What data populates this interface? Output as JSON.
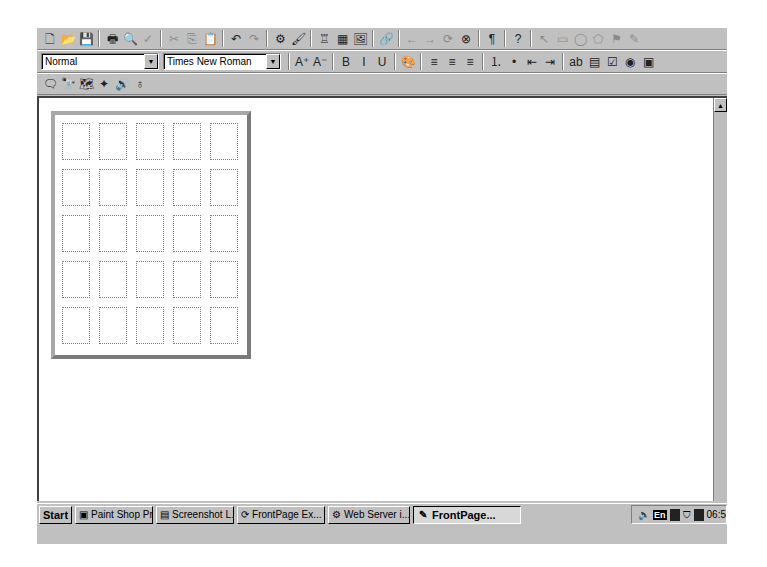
{
  "toolbar_standard": {
    "buttons": [
      {
        "name": "new-page",
        "glyph": "🗋"
      },
      {
        "name": "open",
        "glyph": "📂"
      },
      {
        "name": "save",
        "glyph": "💾"
      },
      {
        "name": "print",
        "glyph": "🖶"
      },
      {
        "name": "print-preview",
        "glyph": "🔍"
      },
      {
        "name": "spelling",
        "glyph": "✓"
      },
      {
        "name": "cut",
        "glyph": "✂"
      },
      {
        "name": "copy",
        "glyph": "⎘"
      },
      {
        "name": "paste",
        "glyph": "📋"
      },
      {
        "name": "undo",
        "glyph": "↶"
      },
      {
        "name": "redo",
        "glyph": "↷"
      },
      {
        "name": "insert-component",
        "glyph": "⚙"
      },
      {
        "name": "format-painter",
        "glyph": "🖌"
      },
      {
        "name": "insert-form-field",
        "glyph": "♖"
      },
      {
        "name": "insert-table",
        "glyph": "▦"
      },
      {
        "name": "insert-image",
        "glyph": "🖼"
      },
      {
        "name": "hyperlink",
        "glyph": "🔗"
      },
      {
        "name": "back",
        "glyph": "←"
      },
      {
        "name": "forward",
        "glyph": "→"
      },
      {
        "name": "refresh",
        "glyph": "⟳"
      },
      {
        "name": "stop",
        "glyph": "⊗"
      },
      {
        "name": "show-all",
        "glyph": "¶"
      },
      {
        "name": "help",
        "glyph": "?"
      },
      {
        "name": "select-pointer",
        "glyph": "↖"
      },
      {
        "name": "rectangle",
        "glyph": "▭"
      },
      {
        "name": "circle",
        "glyph": "◯"
      },
      {
        "name": "polygon",
        "glyph": "⬠"
      },
      {
        "name": "highlight-hotspots",
        "glyph": "⚑"
      },
      {
        "name": "pencil",
        "glyph": "✎"
      }
    ]
  },
  "toolbar_format": {
    "style_value": "Normal",
    "font_value": "Times New Roman",
    "buttons": [
      {
        "name": "increase-font-size",
        "glyph": "A⁺"
      },
      {
        "name": "decrease-font-size",
        "glyph": "A⁻"
      },
      {
        "name": "bold",
        "glyph": "B"
      },
      {
        "name": "italic",
        "glyph": "I"
      },
      {
        "name": "underline",
        "glyph": "U"
      },
      {
        "name": "text-color",
        "glyph": "🎨"
      },
      {
        "name": "align-left",
        "glyph": "≡"
      },
      {
        "name": "align-center",
        "glyph": "≡"
      },
      {
        "name": "align-right",
        "glyph": "≡"
      },
      {
        "name": "numbered-list",
        "glyph": "⒈"
      },
      {
        "name": "bulleted-list",
        "glyph": "•"
      },
      {
        "name": "decrease-indent",
        "glyph": "⇤"
      },
      {
        "name": "increase-indent",
        "glyph": "⇥"
      },
      {
        "name": "one-line-text-box",
        "glyph": "ab"
      },
      {
        "name": "scrolling-text-box",
        "glyph": "▤"
      },
      {
        "name": "check-box",
        "glyph": "☑"
      },
      {
        "name": "radio-button",
        "glyph": "◉"
      },
      {
        "name": "drop-down-menu",
        "glyph": "▣"
      }
    ]
  },
  "toolbar_extra": {
    "buttons": [
      {
        "name": "comment",
        "glyph": "🗨"
      },
      {
        "name": "find",
        "glyph": "🔭"
      },
      {
        "name": "image-map",
        "glyph": "🗺"
      },
      {
        "name": "wand",
        "glyph": "✦"
      },
      {
        "name": "sound",
        "glyph": "🔊"
      },
      {
        "name": "web-component",
        "glyph": "♁"
      }
    ]
  },
  "editor": {
    "table": {
      "rows": 5,
      "columns": 5
    }
  },
  "taskbar": {
    "start_label": "Start",
    "tasks": [
      {
        "label": "Paint Shop Pro",
        "icon": "▣",
        "active": false
      },
      {
        "label": "Screenshot L...",
        "icon": "▤",
        "active": false
      },
      {
        "label": "FrontPage Ex...",
        "icon": "⟳",
        "active": false
      },
      {
        "label": "Web Server i...",
        "icon": "⚙",
        "active": false
      },
      {
        "label": "FrontPage...",
        "icon": "✎",
        "active": true
      }
    ],
    "tray": {
      "language": "En",
      "clock": "06:5"
    }
  }
}
